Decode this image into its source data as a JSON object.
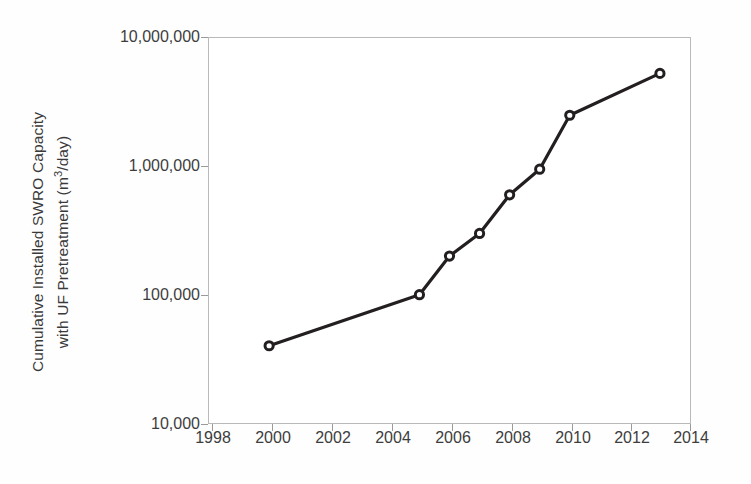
{
  "chart_data": {
    "type": "line",
    "title": "",
    "subtitle": "",
    "xlabel": "",
    "ylabel_line1": "Cumulative Installed SWRO Capacity",
    "ylabel_line2_pre": "with UF Pretreatment (m",
    "ylabel_line2_exp": "3",
    "ylabel_line2_post": "/day)",
    "ylabel_full": "Cumulative Installed SWRO Capacity with UF Pretreatment (m3/day)",
    "yscale": "log",
    "ylim": [
      10000,
      10000000
    ],
    "xlim": [
      1998,
      2014
    ],
    "grid": false,
    "legend": null,
    "x_tick_labels": [
      "1998",
      "2000",
      "2002",
      "2004",
      "2006",
      "2008",
      "2010",
      "2012",
      "2014"
    ],
    "x_tick_values": [
      1998,
      2000,
      2002,
      2004,
      2006,
      2008,
      2010,
      2012,
      2014
    ],
    "y_tick_labels": [
      "10,000,000",
      "1,000,000",
      "100,000",
      "10,000"
    ],
    "y_tick_values": [
      10000000,
      1000000,
      100000,
      10000
    ],
    "x": [
      2000,
      2005,
      2006,
      2007,
      2008,
      2009,
      2010,
      2013
    ],
    "values": [
      40000,
      100000,
      200000,
      300000,
      600000,
      950000,
      2500000,
      5300000
    ],
    "series": [
      {
        "name": "Cumulative Installed SWRO Capacity with UF Pretreatment",
        "x": [
          2000,
          2005,
          2006,
          2007,
          2008,
          2009,
          2010,
          2013
        ],
        "values": [
          40000,
          100000,
          200000,
          300000,
          600000,
          950000,
          2500000,
          5300000
        ]
      }
    ],
    "marker": "open-circle",
    "line_color": "#231f20",
    "marker_face_color": "#ffffff",
    "marker_edge_color": "#231f20",
    "axis_color": "#b9b9b9",
    "text_color": "#3d3d3d",
    "background_color": "#ffffff"
  }
}
